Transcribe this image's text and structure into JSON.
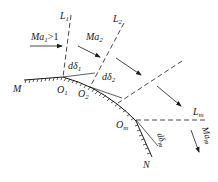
{
  "diagram": {
    "type": "supersonic expansion over convex corner (Prandtl-Meyer)",
    "mach_lines": [
      {
        "id": "L1",
        "label": "L",
        "sub": "1"
      },
      {
        "id": "L2",
        "label": "L",
        "sub": "2"
      },
      {
        "id": "L3",
        "label": "",
        "sub": ""
      },
      {
        "id": "Lm",
        "label": "L",
        "sub": "m"
      }
    ],
    "flow_arrows": [
      {
        "label": "Ma",
        "sub": "1",
        "suffix": ">1"
      },
      {
        "label": "Ma",
        "sub": "2",
        "suffix": ""
      },
      {
        "label": "",
        "sub": "",
        "suffix": ""
      },
      {
        "label": "",
        "sub": "",
        "suffix": ""
      },
      {
        "label": "Ma",
        "sub": "m",
        "suffix": ""
      }
    ],
    "points": [
      {
        "label": "M",
        "sub": ""
      },
      {
        "label": "O",
        "sub": "1"
      },
      {
        "label": "O",
        "sub": "2"
      },
      {
        "label": "O",
        "sub": "m"
      },
      {
        "label": "N",
        "sub": ""
      }
    ],
    "angles": [
      {
        "label": "dδ",
        "sub": "1"
      },
      {
        "label": "dδ",
        "sub": "2"
      },
      {
        "label": "dδ",
        "sub": "m"
      }
    ]
  }
}
